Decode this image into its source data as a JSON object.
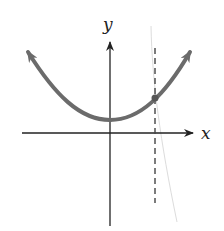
{
  "figure": {
    "type": "graph-of-function",
    "axes": {
      "x_label": "x",
      "y_label": "y"
    },
    "curve": {
      "shape": "parabola opening upward",
      "vertex_position": "on y-axis, above x-axis",
      "endpoints": "arrowheads on both ends",
      "color": "#6b6b6b"
    },
    "vertical_line": {
      "style": "dashed",
      "position": "right of y-axis",
      "color": "#444444"
    },
    "marked_point": {
      "description": "intersection of curve and dashed vertical line",
      "color": "#555555"
    },
    "colors": {
      "axis": "#222222",
      "background": "#ffffff",
      "artifact_line": "#dcdcdc"
    }
  }
}
